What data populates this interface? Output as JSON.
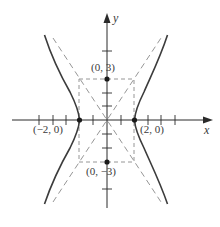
{
  "diagram": {
    "type": "hyperbola",
    "equation": "x^2/4 - y^2/9 = 1",
    "axes": {
      "x_label": "x",
      "y_label": "y"
    },
    "points": [
      {
        "label": "(0, 3)",
        "x": 0,
        "y": 3
      },
      {
        "label": "(0, −3)",
        "x": 0,
        "y": -3
      },
      {
        "label": "(−2, 0)",
        "x": -2,
        "y": 0
      },
      {
        "label": "(2, 0)",
        "x": 2,
        "y": 0
      }
    ],
    "x_ticks": [
      -5,
      -4,
      -3,
      -1,
      1,
      3,
      4,
      5
    ],
    "y_ticks": [
      -5,
      -2,
      -1,
      1,
      2,
      5
    ],
    "asymptotes": [
      "y = 1.5x",
      "y = -1.5x"
    ],
    "central_rectangle": {
      "x": [
        -2,
        2
      ],
      "y": [
        -3,
        3
      ]
    },
    "colors": {
      "curve": "#3c3c3c",
      "axes": "#2a2a2a",
      "dashed": "#8a8a8a"
    }
  }
}
